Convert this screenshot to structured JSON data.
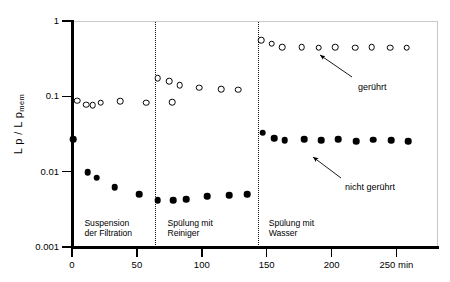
{
  "chart_data": {
    "type": "scatter",
    "title": "",
    "xlabel": "min",
    "ylabel": "L p / L p mem",
    "ylabel_parts": {
      "main": "L p  / L p",
      "sub": "mem"
    },
    "yscale": "log",
    "ylim": [
      0.001,
      1
    ],
    "xlim": [
      0,
      282
    ],
    "grid": false,
    "legend_position": "inline-annotation",
    "y_ticks": [
      "1",
      "0.1",
      "0.01",
      "0.001"
    ],
    "y_tick_values": [
      1,
      0.1,
      0.01,
      0.001
    ],
    "x_ticks": [
      "0",
      "50",
      "100",
      "150",
      "200",
      "250 min"
    ],
    "x_tick_values": [
      0,
      50,
      100,
      150,
      200,
      250
    ],
    "series": [
      {
        "name": "gerührt",
        "marker": "open-circle",
        "color": "#000000",
        "points": [
          {
            "x": 4,
            "y": 0.088
          },
          {
            "x": 11,
            "y": 0.077
          },
          {
            "x": 16,
            "y": 0.076
          },
          {
            "x": 22,
            "y": 0.082
          },
          {
            "x": 37,
            "y": 0.086
          },
          {
            "x": 57,
            "y": 0.082
          },
          {
            "x": 77,
            "y": 0.083
          },
          {
            "x": 66,
            "y": 0.175
          },
          {
            "x": 75,
            "y": 0.16
          },
          {
            "x": 83,
            "y": 0.14
          },
          {
            "x": 98,
            "y": 0.13
          },
          {
            "x": 115,
            "y": 0.125
          },
          {
            "x": 128,
            "y": 0.122
          },
          {
            "x": 146,
            "y": 0.56
          },
          {
            "x": 154,
            "y": 0.5
          },
          {
            "x": 162,
            "y": 0.445
          },
          {
            "x": 177,
            "y": 0.45
          },
          {
            "x": 190,
            "y": 0.44
          },
          {
            "x": 203,
            "y": 0.445
          },
          {
            "x": 218,
            "y": 0.44
          },
          {
            "x": 231,
            "y": 0.45
          },
          {
            "x": 245,
            "y": 0.44
          },
          {
            "x": 258,
            "y": 0.44
          }
        ]
      },
      {
        "name": "nicht gerührt",
        "marker": "filled-circle",
        "color": "#000000",
        "points": [
          {
            "x": 1,
            "y": 0.027
          },
          {
            "x": 12,
            "y": 0.0098
          },
          {
            "x": 19,
            "y": 0.0083
          },
          {
            "x": 33,
            "y": 0.0062
          },
          {
            "x": 52,
            "y": 0.005
          },
          {
            "x": 66,
            "y": 0.0042
          },
          {
            "x": 78,
            "y": 0.0042
          },
          {
            "x": 88,
            "y": 0.0043
          },
          {
            "x": 104,
            "y": 0.0047
          },
          {
            "x": 121,
            "y": 0.0049
          },
          {
            "x": 135,
            "y": 0.005
          },
          {
            "x": 147,
            "y": 0.033
          },
          {
            "x": 156,
            "y": 0.0278
          },
          {
            "x": 164,
            "y": 0.026
          },
          {
            "x": 179,
            "y": 0.0268
          },
          {
            "x": 192,
            "y": 0.026
          },
          {
            "x": 205,
            "y": 0.0268
          },
          {
            "x": 219,
            "y": 0.0255
          },
          {
            "x": 232,
            "y": 0.0265
          },
          {
            "x": 246,
            "y": 0.0262
          },
          {
            "x": 259,
            "y": 0.0255
          }
        ]
      }
    ],
    "dividers": [
      {
        "x": 64
      },
      {
        "x": 143
      }
    ],
    "phase_labels": [
      {
        "text": "Suspension\nder Filtration",
        "x": 8,
        "y": 0.0021
      },
      {
        "text": "Spülung mit\nReiniger",
        "x": 72,
        "y": 0.0021
      },
      {
        "text": "Spülung mit\nWasser",
        "x": 150,
        "y": 0.0021
      }
    ],
    "annotations": [
      {
        "text": "gerührt",
        "text_x": 358,
        "text_y": 82,
        "arrow_from_x": 352,
        "arrow_from_y": 77,
        "arrow_to_x": 320,
        "arrow_to_y": 55
      },
      {
        "text": "nicht gerührt",
        "text_x": 345,
        "text_y": 182,
        "arrow_from_x": 341,
        "arrow_from_y": 178,
        "arrow_to_x": 313,
        "arrow_to_y": 157
      }
    ]
  }
}
